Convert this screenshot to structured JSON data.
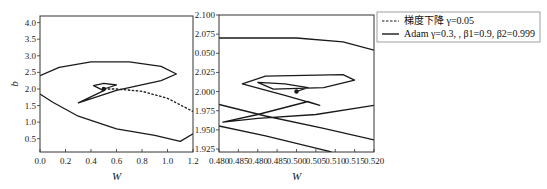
{
  "chart_data": [
    {
      "type": "line",
      "title": "",
      "xlabel": "W",
      "ylabel": "b",
      "xlim": [
        0.0,
        1.2
      ],
      "ylim": [
        0.1,
        4.2
      ],
      "x_ticks": [
        "0.0",
        "0.2",
        "0.4",
        "0.6",
        "0.8",
        "1.0",
        "1.2"
      ],
      "y_ticks": [
        "0.5",
        "1.0",
        "1.5",
        "2.0",
        "2.5",
        "3.0",
        "3.5",
        "4.0"
      ],
      "grid": false,
      "series": [
        {
          "name": "梯度下降 γ=0.05",
          "style": "dashed",
          "points": [
            [
              0.5,
              2.0
            ],
            [
              0.6,
              2.0
            ],
            [
              0.8,
              1.93
            ],
            [
              1.0,
              1.72
            ],
            [
              1.2,
              1.32
            ]
          ]
        },
        {
          "name": "Adam γ=0.3, , β1=0.9, β2=0.999",
          "style": "solid",
          "points": [
            [
              0.0,
              1.85
            ],
            [
              0.1,
              1.6
            ],
            [
              0.3,
              1.18
            ],
            [
              0.6,
              0.8
            ],
            [
              0.9,
              0.6
            ],
            [
              1.1,
              0.42
            ],
            [
              1.2,
              0.65
            ],
            [
              null,
              null
            ],
            [
              0.0,
              2.4
            ],
            [
              0.15,
              2.65
            ],
            [
              0.4,
              2.82
            ],
            [
              0.7,
              2.82
            ],
            [
              0.95,
              2.68
            ],
            [
              1.07,
              2.45
            ],
            [
              0.95,
              2.25
            ],
            [
              0.6,
              1.96
            ],
            [
              0.3,
              1.58
            ],
            [
              0.5,
              1.95
            ],
            [
              0.42,
              2.1
            ],
            [
              0.5,
              2.17
            ],
            [
              0.6,
              2.12
            ],
            [
              0.5,
              2.0
            ]
          ]
        }
      ]
    },
    {
      "type": "line",
      "title": "",
      "xlabel": "W",
      "ylabel": "",
      "xlim": [
        0.48,
        0.52
      ],
      "ylim": [
        1.921,
        2.1
      ],
      "x_ticks": [
        "0.480",
        "0.485",
        "0.480",
        "0.485",
        "0.500",
        "0.505",
        "0.510",
        "0.515",
        "0.520"
      ],
      "y_ticks": [
        "1.925",
        "1.950",
        "1.975",
        "2.000",
        "2.025",
        "0.050",
        "2.075",
        "2.100"
      ],
      "grid": false,
      "series": [
        {
          "name": "Adam γ=0.3, , β1=0.9, β2=0.999",
          "style": "solid",
          "points": [
            [
              0.48,
              2.07
            ],
            [
              0.5,
              2.07
            ],
            [
              0.512,
              2.065
            ],
            [
              0.52,
              2.054
            ],
            [
              null,
              null
            ],
            [
              0.48,
              1.983
            ],
            [
              0.492,
              1.968
            ],
            [
              0.507,
              1.952
            ],
            [
              0.52,
              1.937
            ],
            [
              null,
              null
            ],
            [
              0.48,
              1.955
            ],
            [
              0.492,
              1.942
            ],
            [
              0.505,
              1.926
            ],
            [
              0.509,
              1.921
            ],
            [
              null,
              null
            ],
            [
              0.52,
              1.982
            ],
            [
              0.505,
              1.97
            ],
            [
              0.49,
              1.965
            ],
            [
              0.481,
              1.96
            ],
            [
              0.49,
              1.97
            ],
            [
              0.503,
              1.987
            ],
            [
              0.506,
              1.982
            ],
            [
              0.497,
              1.995
            ],
            [
              0.486,
              2.01
            ],
            [
              0.492,
              2.02
            ],
            [
              0.512,
              2.022
            ],
            [
              0.515,
              2.015
            ],
            [
              0.507,
              2.005
            ],
            [
              0.494,
              2.003
            ],
            [
              0.49,
              2.012
            ],
            [
              0.497,
              2.01
            ],
            [
              0.503,
              2.005
            ],
            [
              0.5,
              2.0
            ]
          ]
        }
      ]
    }
  ],
  "legend": {
    "items": [
      {
        "label": "梯度下降 γ=0.05",
        "style": "dashed"
      },
      {
        "label": "Adam γ=0.3, , β1=0.9, β2=0.999",
        "style": "solid"
      }
    ]
  },
  "colors": {
    "line": "#1a1a1a",
    "axis": "#333333",
    "background": "#ffffff"
  }
}
